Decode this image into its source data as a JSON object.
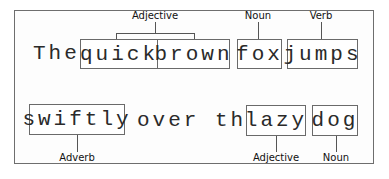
{
  "diagram": {
    "type": "part-of-speech annotation",
    "line1": {
      "plain_word": "The",
      "boxes": [
        {
          "word": "quick"
        },
        {
          "word": "brown"
        },
        {
          "word": "fox"
        },
        {
          "word": "jumps"
        }
      ],
      "labels": [
        {
          "text": "Adjective",
          "targets": [
            "quick",
            "brown"
          ]
        },
        {
          "text": "Noun",
          "targets": [
            "fox"
          ]
        },
        {
          "text": "Verb",
          "targets": [
            "jumps"
          ]
        }
      ]
    },
    "line2": {
      "boxes": [
        {
          "word": "swiftly"
        },
        {
          "word": "lazy"
        },
        {
          "word": "dog"
        }
      ],
      "plain_words": "over the",
      "labels": [
        {
          "text": "Adverb",
          "targets": [
            "swiftly"
          ]
        },
        {
          "text": "Adjective",
          "targets": [
            "lazy"
          ]
        },
        {
          "text": "Noun",
          "targets": [
            "dog"
          ]
        }
      ]
    },
    "colors": {
      "line": "#555555",
      "text": "#2a2a2a",
      "frame": "#6e6e6e"
    }
  }
}
